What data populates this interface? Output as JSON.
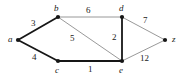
{
  "figure": {
    "name": "weighted-undirected-graph",
    "width": 185,
    "height": 83,
    "background": "#ffffff"
  },
  "style": {
    "thick_edge_color": "#161616",
    "thin_edge_color": "#8d8d8d",
    "thick_edge_width": 1.8,
    "thin_edge_width": 0.9,
    "vertex_color": "#161616",
    "vertex_radius": 2.1,
    "label_color": "#1a1a1a"
  },
  "chart_data": {
    "type": "graph",
    "title": "",
    "directed": false,
    "weighted": true,
    "nodes": [
      {
        "id": "a",
        "label": "a",
        "x": 18,
        "y": 40,
        "label_x": 8,
        "label_y": 35
      },
      {
        "id": "b",
        "label": "b",
        "x": 58,
        "y": 17,
        "label_x": 54,
        "label_y": 4
      },
      {
        "id": "c",
        "label": "c",
        "x": 58,
        "y": 61,
        "label_x": 55,
        "label_y": 66
      },
      {
        "id": "d",
        "label": "d",
        "x": 122,
        "y": 17,
        "label_x": 119,
        "label_y": 4
      },
      {
        "id": "e",
        "label": "e",
        "x": 122,
        "y": 61,
        "label_x": 119,
        "label_y": 66
      },
      {
        "id": "z",
        "label": "z",
        "x": 165,
        "y": 40,
        "label_x": 172,
        "label_y": 35
      }
    ],
    "edges": [
      {
        "source": "a",
        "target": "b",
        "weight": 3,
        "style": "thick",
        "label_x": 31,
        "label_y": 19
      },
      {
        "source": "a",
        "target": "c",
        "weight": 4,
        "style": "thick",
        "label_x": 32,
        "label_y": 53
      },
      {
        "source": "b",
        "target": "d",
        "weight": 6,
        "style": "thin",
        "label_x": 86,
        "label_y": 6
      },
      {
        "source": "b",
        "target": "e",
        "weight": 5,
        "style": "thin",
        "label_x": 70,
        "label_y": 34
      },
      {
        "source": "c",
        "target": "e",
        "weight": 1,
        "style": "thick",
        "label_x": 88,
        "label_y": 65
      },
      {
        "source": "d",
        "target": "e",
        "weight": 2,
        "style": "thick",
        "label_x": 112,
        "label_y": 33
      },
      {
        "source": "d",
        "target": "z",
        "weight": 7,
        "style": "thin",
        "label_x": 143,
        "label_y": 16
      },
      {
        "source": "e",
        "target": "z",
        "weight": 12,
        "style": "thin",
        "label_x": 140,
        "label_y": 54
      }
    ],
    "node_ids": [
      "a",
      "b",
      "c",
      "d",
      "e",
      "z"
    ],
    "weights": [
      3,
      4,
      6,
      5,
      1,
      2,
      7,
      12
    ],
    "xlabel": "",
    "ylabel": "",
    "legend": [],
    "grid": false
  }
}
